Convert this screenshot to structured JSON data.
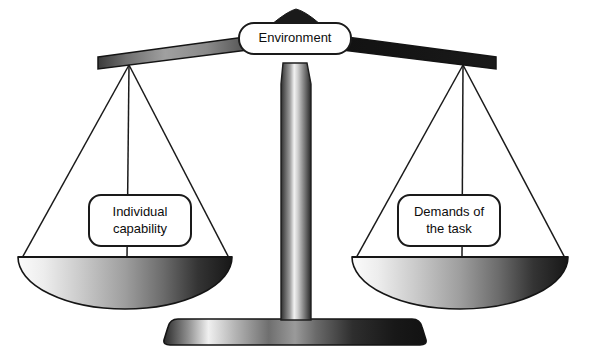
{
  "figure": {
    "name": "balance-scale-diagram",
    "background_color": "#ffffff",
    "ink_color": "#1a1a1a"
  },
  "labels": {
    "fulcrum": {
      "text": "Environment",
      "position": "top-center-on-beam"
    },
    "left_pan": {
      "text": "Individual\ncapability",
      "line1": "Individual",
      "line2": "capability",
      "position": "left-pan"
    },
    "right_pan": {
      "text": "Demands of\nthe task",
      "line1": "Demands of",
      "line2": "the task",
      "position": "right-pan"
    }
  },
  "parts": {
    "beam": "balance-beam",
    "column": "center-column",
    "base": "base-plinth",
    "left_pan": "left-pan-dish",
    "right_pan": "right-pan-dish",
    "strings": "suspension-strings",
    "fulcrum_cap": "fulcrum-cap"
  },
  "colors": {
    "outline": "#1a1a1a",
    "beam_light": "#8f8f8f",
    "beam_dark": "#121212",
    "pan_light": "#f2f2f2",
    "pan_dark": "#1b1b1b",
    "column_light": "#ededed",
    "column_dark": "#2a2a2a",
    "base_light": "#f0f0f0",
    "base_dark": "#141414",
    "box_fill": "#ffffff"
  }
}
